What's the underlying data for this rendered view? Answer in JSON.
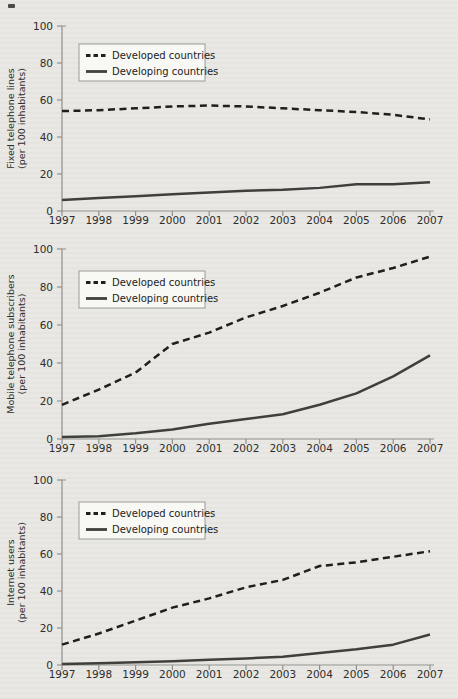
{
  "page": {
    "background_color": "#e9e8e4",
    "axis_color": "#8f8f8d",
    "tick_label_color": "#2e2e2c",
    "legend_background": "#f8f8f5",
    "legend_border": "#9a9a98"
  },
  "legend": {
    "items": [
      {
        "label": "Developed countries",
        "style": "dashed"
      },
      {
        "label": "Developing countries",
        "style": "solid"
      }
    ]
  },
  "chart_data": [
    {
      "type": "line",
      "title": "",
      "ylabel": "Fixed telephone lines",
      "ylabel2": "(per 100 inhabitants)",
      "xlabel": "",
      "x": [
        1997,
        1998,
        1999,
        2000,
        2001,
        2002,
        2003,
        2004,
        2005,
        2006,
        2007
      ],
      "ylim": [
        0,
        100
      ],
      "yticks": [
        0,
        20,
        40,
        60,
        80,
        100
      ],
      "grid": false,
      "legend_position": "upper-left",
      "series": [
        {
          "name": "Developed countries",
          "style": "dashed",
          "color": "#1f1f1d",
          "values": [
            54,
            54.5,
            55.5,
            56.5,
            57,
            56.5,
            55.5,
            54.5,
            53.5,
            52,
            49.5
          ]
        },
        {
          "name": "Developing countries",
          "style": "solid",
          "color": "#3f3f3d",
          "values": [
            6,
            7,
            8,
            9,
            10,
            11,
            11.5,
            12.5,
            14.5,
            14.5,
            15.5
          ]
        }
      ]
    },
    {
      "type": "line",
      "title": "",
      "ylabel": "Mobile telephone subscribers",
      "ylabel2": "(per 100 inhabitants)",
      "xlabel": "",
      "x": [
        1997,
        1998,
        1999,
        2000,
        2001,
        2002,
        2003,
        2004,
        2005,
        2006,
        2007
      ],
      "ylim": [
        0,
        100
      ],
      "yticks": [
        0,
        20,
        40,
        60,
        80,
        100
      ],
      "grid": false,
      "legend_position": "upper-left",
      "series": [
        {
          "name": "Developed countries",
          "style": "dashed",
          "color": "#1f1f1d",
          "values": [
            18,
            26,
            35,
            50,
            56,
            64,
            70,
            77,
            85,
            90,
            96
          ]
        },
        {
          "name": "Developing countries",
          "style": "solid",
          "color": "#3f3f3d",
          "values": [
            1,
            1.5,
            3,
            5,
            8,
            10.5,
            13,
            18,
            24,
            33,
            44
          ]
        }
      ]
    },
    {
      "type": "line",
      "title": "",
      "ylabel": "Internet users",
      "ylabel2": "(per 100 inhabitants)",
      "xlabel": "",
      "x": [
        1997,
        1998,
        1999,
        2000,
        2001,
        2002,
        2003,
        2004,
        2005,
        2006,
        2007
      ],
      "ylim": [
        0,
        100
      ],
      "yticks": [
        0,
        20,
        40,
        60,
        80,
        100
      ],
      "grid": false,
      "legend_position": "upper-left",
      "series": [
        {
          "name": "Developed countries",
          "style": "dashed",
          "color": "#1f1f1d",
          "values": [
            11,
            17,
            24,
            31,
            36,
            42,
            46,
            53.5,
            55.5,
            58.5,
            61.5
          ]
        },
        {
          "name": "Developing countries",
          "style": "solid",
          "color": "#3f3f3d",
          "values": [
            0.5,
            1,
            1.5,
            2,
            2.8,
            3.5,
            4.5,
            6.5,
            8.5,
            11,
            16.5
          ]
        }
      ]
    }
  ]
}
